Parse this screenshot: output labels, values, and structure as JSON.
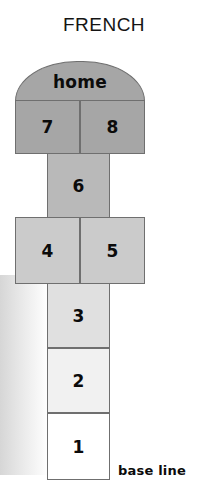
{
  "title": "FRENCH",
  "diagram": {
    "type": "hopscotch-court",
    "base_line_label": "base line",
    "home": {
      "label": "home",
      "shape": "dome",
      "fill": "#a6a6a6"
    },
    "cells": [
      {
        "label": "7",
        "fill": "#a6a6a6",
        "row": "seven-eight",
        "side": "left"
      },
      {
        "label": "8",
        "fill": "#a6a6a6",
        "row": "seven-eight",
        "side": "right"
      },
      {
        "label": "6",
        "fill": "#b9b9b9",
        "row": "six",
        "side": "center"
      },
      {
        "label": "4",
        "fill": "#cbcbcb",
        "row": "four-five",
        "side": "left"
      },
      {
        "label": "5",
        "fill": "#cbcbcb",
        "row": "four-five",
        "side": "right"
      },
      {
        "label": "3",
        "fill": "#e0e0e0",
        "row": "three",
        "side": "center"
      },
      {
        "label": "2",
        "fill": "#f1f1f1",
        "row": "two",
        "side": "center"
      },
      {
        "label": "1",
        "fill": "#ffffff",
        "row": "one",
        "side": "center"
      }
    ]
  },
  "colors": {
    "outline": "#6f6f6f",
    "text": "#0b0b0b",
    "background": "#ffffff"
  }
}
